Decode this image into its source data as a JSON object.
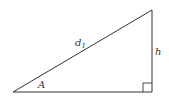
{
  "diagram": {
    "type": "right-triangle",
    "labels": {
      "hypotenuse": "d",
      "hypotenuse_subscript": "1",
      "height": "h",
      "angle": "A"
    },
    "right_angle_marker": true,
    "stroke_color": "#333333",
    "vertices": {
      "bottom_left": [
        13,
        92
      ],
      "bottom_right": [
        152,
        92
      ],
      "top_right": [
        152,
        10
      ]
    }
  }
}
